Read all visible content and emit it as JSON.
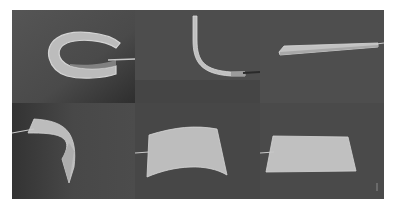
{
  "figure": {
    "layout": "3x2 grid of grayscale photographs",
    "panels": [
      {
        "position": "top-left",
        "subject": "strip-curled-into-loop"
      },
      {
        "position": "top-middle",
        "subject": "strip-bent-into-L-curve"
      },
      {
        "position": "top-right",
        "subject": "flat-thin-strip"
      },
      {
        "position": "bottom-left",
        "subject": "sheet-folded-twisted"
      },
      {
        "position": "bottom-middle",
        "subject": "sheet-arched-curved"
      },
      {
        "position": "bottom-right",
        "subject": "flat-sheet"
      }
    ],
    "colors": {
      "background": "#4a4a4a",
      "background_dark": "#3a3a3a",
      "sample": "#bdbdbd",
      "sample_edge": "#d6d6d6",
      "wire": "#c8c8c8",
      "page": "#ffffff"
    }
  }
}
